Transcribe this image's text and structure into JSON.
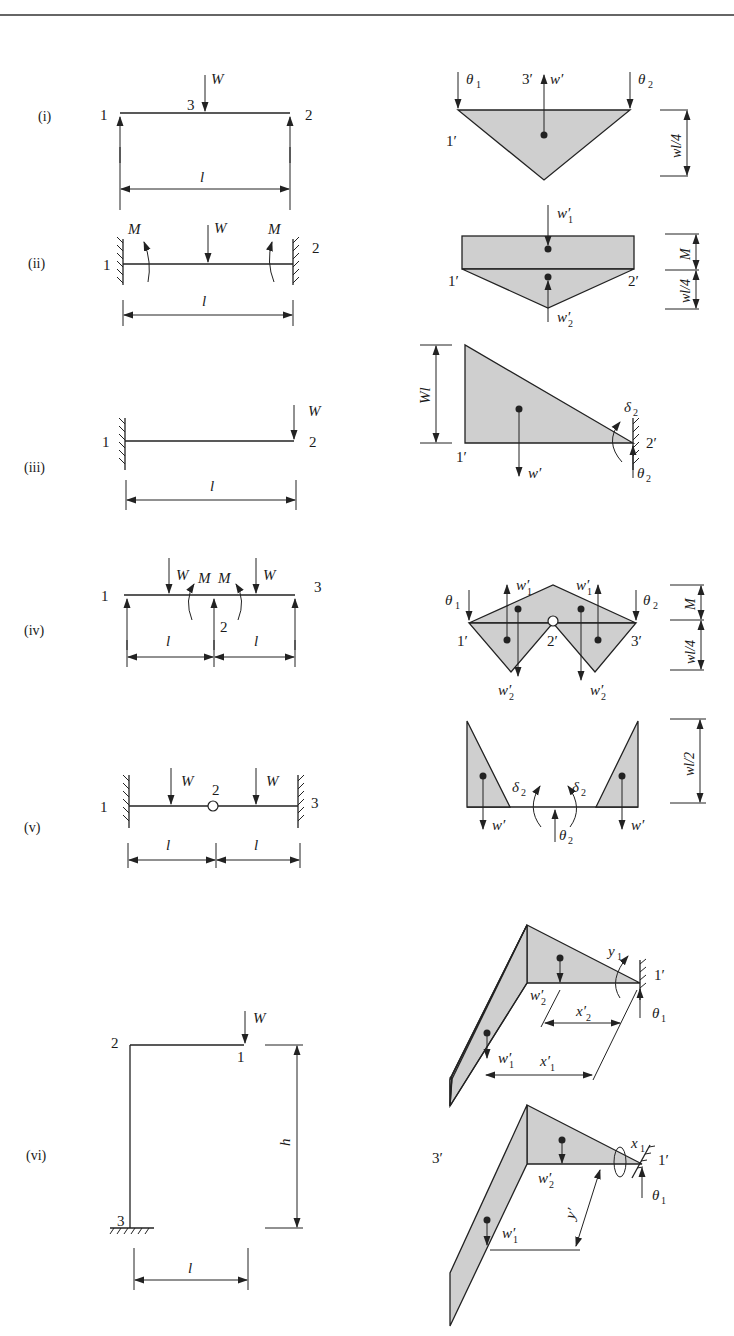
{
  "figure": {
    "header_rule": true,
    "fill_color": "#cfcfcf",
    "line_color": "#222222",
    "cases": [
      {
        "id": "i",
        "label": "(i)",
        "structure": {
          "type": "simply-supported beam, central point load",
          "nodes": [
            "1",
            "3",
            "2"
          ],
          "load": "W",
          "span": "l"
        },
        "mechanism": {
          "node_labels": [
            "1′",
            "3′"
          ],
          "rotations": [
            "θ",
            "θ"
          ],
          "rotation_subs": [
            "1",
            "2"
          ],
          "force": "w′",
          "dimension": "wl/4"
        }
      },
      {
        "id": "ii",
        "label": "(ii)",
        "structure": {
          "type": "fixed-fixed beam, central point load",
          "nodes": [
            "1",
            "2"
          ],
          "load": "W",
          "moments": [
            "M",
            "M"
          ],
          "span": "l"
        },
        "mechanism": {
          "node_labels": [
            "1′",
            "2′"
          ],
          "forces": [
            "w′",
            "w′"
          ],
          "force_subs": [
            "1",
            "2"
          ],
          "dimensions": [
            "M",
            "wl/4"
          ]
        }
      },
      {
        "id": "iii",
        "label": "(iii)",
        "structure": {
          "type": "cantilever, end point load",
          "nodes": [
            "1",
            "2"
          ],
          "load": "W",
          "span": "l"
        },
        "mechanism": {
          "node_labels": [
            "1′",
            "2′"
          ],
          "force": "w′",
          "rotation": "θ",
          "rotation_sub": "2",
          "deflection": "δ",
          "deflection_sub": "2",
          "dimension": "Wl"
        }
      },
      {
        "id": "iv",
        "label": "(iv)",
        "structure": {
          "type": "two-span continuous beam, point loads",
          "nodes": [
            "1",
            "2",
            "3"
          ],
          "loads": [
            "W",
            "W"
          ],
          "moments": [
            "M",
            "M"
          ],
          "spans": [
            "l",
            "l"
          ]
        },
        "mechanism": {
          "node_labels": [
            "1′",
            "2′",
            "3′"
          ],
          "rotations": [
            "θ",
            "θ"
          ],
          "rotation_subs": [
            "1",
            "2"
          ],
          "forces_up": [
            "w′",
            "w′"
          ],
          "forces_up_sub": "1",
          "forces_down": [
            "w′",
            "w′"
          ],
          "forces_down_sub": "2",
          "dimensions": [
            "M",
            "wl/4"
          ]
        }
      },
      {
        "id": "v",
        "label": "(v)",
        "structure": {
          "type": "fixed-fixed beam with hinge, point loads",
          "nodes": [
            "1",
            "2",
            "3"
          ],
          "loads": [
            "W",
            "W"
          ],
          "spans": [
            "l",
            "l"
          ]
        },
        "mechanism": {
          "forces": [
            "w′",
            "w′"
          ],
          "deflections": [
            "δ",
            "δ"
          ],
          "deflection_sub": "2",
          "rotation": "θ",
          "rotation_sub": "2",
          "dimension": "wl/2"
        }
      },
      {
        "id": "vi",
        "label": "(vi)",
        "structure": {
          "type": "cantilever frame (L-shaped), end load",
          "nodes": [
            "2",
            "1",
            "3"
          ],
          "load": "W",
          "height": "h",
          "span": "l"
        },
        "mechanism_a": {
          "node_labels": [
            "1′",
            "3′"
          ],
          "forces": [
            "w′",
            "w′"
          ],
          "force_subs": [
            "2",
            "1"
          ],
          "distances": [
            "x′",
            "x′"
          ],
          "distance_subs": [
            "2",
            "1"
          ],
          "rotation": "y",
          "rotation_sub": "1",
          "twist": "θ",
          "twist_sub": "1"
        },
        "mechanism_b": {
          "node_labels": [
            "1′"
          ],
          "forces": [
            "w′",
            "w′"
          ],
          "force_subs": [
            "2",
            "1"
          ],
          "distance": "y′",
          "distance_sub": "1",
          "rotation": "x",
          "rotation_sub": "1",
          "twist": "θ",
          "twist_sub": "1"
        }
      }
    ]
  }
}
